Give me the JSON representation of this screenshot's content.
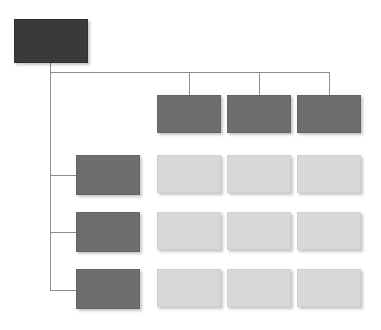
{
  "diagram": {
    "type": "organizational-hierarchy-chart",
    "canvas": {
      "width": 381,
      "height": 330,
      "background": "#ffffff"
    },
    "palette": {
      "root_fill": "#3a3a3a",
      "primary_fill": "#6e6e6e",
      "secondary_fill": "#d8d8d8",
      "connector_stroke": "#8c8c8c",
      "background": "#ffffff"
    },
    "nodes": {
      "root": {
        "label": "",
        "level": "root",
        "fill": "#3a3a3a",
        "x": 14,
        "y": 19,
        "w": 74,
        "h": 44
      },
      "top_row": [
        {
          "label": "",
          "level": "primary",
          "fill": "#6e6e6e",
          "x": 157,
          "y": 95,
          "w": 64,
          "h": 38
        },
        {
          "label": "",
          "level": "primary",
          "fill": "#6e6e6e",
          "x": 227,
          "y": 95,
          "w": 64,
          "h": 38
        },
        {
          "label": "",
          "level": "primary",
          "fill": "#6e6e6e",
          "x": 297,
          "y": 95,
          "w": 64,
          "h": 38
        }
      ],
      "left_column": [
        {
          "label": "",
          "level": "primary",
          "fill": "#6e6e6e",
          "x": 76,
          "y": 155,
          "w": 64,
          "h": 40
        },
        {
          "label": "",
          "level": "primary",
          "fill": "#6e6e6e",
          "x": 76,
          "y": 212,
          "w": 64,
          "h": 40
        },
        {
          "label": "",
          "level": "primary",
          "fill": "#6e6e6e",
          "x": 76,
          "y": 269,
          "w": 64,
          "h": 40
        }
      ],
      "grid": [
        {
          "label": "",
          "level": "secondary",
          "fill": "#d8d8d8",
          "x": 157,
          "y": 155,
          "w": 64,
          "h": 38
        },
        {
          "label": "",
          "level": "secondary",
          "fill": "#d8d8d8",
          "x": 227,
          "y": 155,
          "w": 64,
          "h": 38
        },
        {
          "label": "",
          "level": "secondary",
          "fill": "#d8d8d8",
          "x": 297,
          "y": 155,
          "w": 64,
          "h": 38
        },
        {
          "label": "",
          "level": "secondary",
          "fill": "#d8d8d8",
          "x": 157,
          "y": 212,
          "w": 64,
          "h": 38
        },
        {
          "label": "",
          "level": "secondary",
          "fill": "#d8d8d8",
          "x": 227,
          "y": 212,
          "w": 64,
          "h": 38
        },
        {
          "label": "",
          "level": "secondary",
          "fill": "#d8d8d8",
          "x": 297,
          "y": 212,
          "w": 64,
          "h": 38
        },
        {
          "label": "",
          "level": "secondary",
          "fill": "#d8d8d8",
          "x": 157,
          "y": 269,
          "w": 64,
          "h": 38
        },
        {
          "label": "",
          "level": "secondary",
          "fill": "#d8d8d8",
          "x": 227,
          "y": 269,
          "w": 64,
          "h": 38
        },
        {
          "label": "",
          "level": "secondary",
          "fill": "#d8d8d8",
          "x": 297,
          "y": 269,
          "w": 64,
          "h": 38
        }
      ]
    },
    "connectors": {
      "root_stem": {
        "orient": "v",
        "x": 50,
        "y": 63,
        "len": 9
      },
      "horizontal_bus": {
        "orient": "h",
        "x": 50,
        "y": 72,
        "len": 279
      },
      "spine": {
        "orient": "v",
        "x": 50,
        "y": 72,
        "len": 218
      },
      "drop_top_1": {
        "orient": "v",
        "x": 189,
        "y": 72,
        "len": 23
      },
      "drop_top_2": {
        "orient": "v",
        "x": 259,
        "y": 72,
        "len": 23
      },
      "drop_top_3": {
        "orient": "v",
        "x": 329,
        "y": 72,
        "len": 23
      },
      "stub_left_1": {
        "orient": "h",
        "x": 50,
        "y": 175,
        "len": 26
      },
      "stub_left_2": {
        "orient": "h",
        "x": 50,
        "y": 232,
        "len": 26
      },
      "stub_left_3": {
        "orient": "h",
        "x": 50,
        "y": 290,
        "len": 26
      }
    }
  }
}
